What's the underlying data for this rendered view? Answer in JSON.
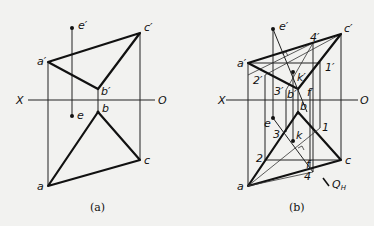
{
  "figure_a": {
    "caption": "(a)",
    "axis": {
      "left": "X",
      "right": "O"
    },
    "labels": {
      "e_prime": "e′",
      "c_prime": "c′",
      "a_prime": "a′",
      "b_prime": "b′",
      "b": "b",
      "e": "e",
      "c": "c",
      "a": "a"
    }
  },
  "figure_b": {
    "caption": "(b)",
    "axis": {
      "left": "X",
      "right": "O"
    },
    "labels": {
      "e_prime": "e′",
      "c_prime": "c′",
      "a_prime": "a′",
      "b_prime": "b′",
      "four_prime": "4′",
      "one_prime": "1′",
      "two_prime": "2′",
      "three_prime": "3′",
      "k_prime": "k′",
      "f_prime": "f′",
      "b": "b",
      "e": "e",
      "c": "c",
      "a": "a",
      "one": "1",
      "two": "2",
      "three": "3",
      "four": "4",
      "k": "k",
      "f": "f",
      "plane": "Q",
      "plane_sub": "H"
    }
  }
}
